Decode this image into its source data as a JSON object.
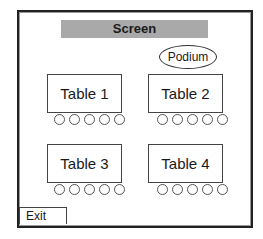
{
  "screen": {
    "label": "Screen"
  },
  "podium": {
    "label": "Podium"
  },
  "tables": [
    {
      "label": "Table 1",
      "chairs": 5
    },
    {
      "label": "Table 2",
      "chairs": 5
    },
    {
      "label": "Table 3",
      "chairs": 5
    },
    {
      "label": "Table 4",
      "chairs": 5
    }
  ],
  "exit": {
    "label": "Exit"
  },
  "colors": {
    "screen": "#a9a9a9",
    "border": "#222222"
  }
}
